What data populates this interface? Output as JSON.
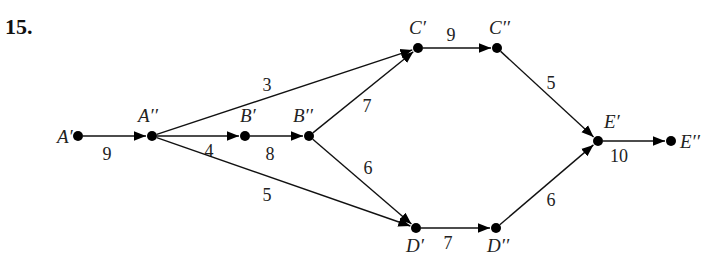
{
  "problem_number": "15.",
  "nodes": [
    {
      "id": "A1",
      "label": "A′",
      "x": 78,
      "y": 136,
      "lx": 57,
      "ly": 143
    },
    {
      "id": "A2",
      "label": "A′′",
      "x": 152,
      "y": 136,
      "lx": 138,
      "ly": 122
    },
    {
      "id": "B1",
      "label": "B′",
      "x": 245,
      "y": 136,
      "lx": 240,
      "ly": 122
    },
    {
      "id": "B2",
      "label": "B′′",
      "x": 309,
      "y": 136,
      "lx": 293,
      "ly": 122
    },
    {
      "id": "C1",
      "label": "C′",
      "x": 418,
      "y": 48,
      "lx": 409,
      "ly": 34
    },
    {
      "id": "C2",
      "label": "C′′",
      "x": 497,
      "y": 48,
      "lx": 489,
      "ly": 34
    },
    {
      "id": "D1",
      "label": "D′",
      "x": 416,
      "y": 228,
      "lx": 406,
      "ly": 252
    },
    {
      "id": "D2",
      "label": "D′′",
      "x": 496,
      "y": 228,
      "lx": 487,
      "ly": 252
    },
    {
      "id": "E1",
      "label": "E′",
      "x": 598,
      "y": 141,
      "lx": 604,
      "ly": 128
    },
    {
      "id": "E2",
      "label": "E′′",
      "x": 671,
      "y": 141,
      "lx": 680,
      "ly": 148
    }
  ],
  "edges": [
    {
      "from": "A1",
      "to": "A2",
      "weight": "9",
      "wx": 107,
      "wy": 160
    },
    {
      "from": "A2",
      "to": "B1",
      "weight": "4",
      "wx": 209,
      "wy": 157
    },
    {
      "from": "A2",
      "to": "C1",
      "weight": "3",
      "wx": 267,
      "wy": 91
    },
    {
      "from": "A2",
      "to": "D1",
      "weight": "5",
      "wx": 267,
      "wy": 201
    },
    {
      "from": "B1",
      "to": "B2",
      "weight": "8",
      "wx": 270,
      "wy": 160
    },
    {
      "from": "B2",
      "to": "C1",
      "weight": "7",
      "wx": 367,
      "wy": 112
    },
    {
      "from": "B2",
      "to": "D1",
      "weight": "6",
      "wx": 368,
      "wy": 174
    },
    {
      "from": "C1",
      "to": "C2",
      "weight": "9",
      "wx": 451,
      "wy": 41
    },
    {
      "from": "C2",
      "to": "E1",
      "weight": "5",
      "wx": 551,
      "wy": 89
    },
    {
      "from": "D1",
      "to": "D2",
      "weight": "7",
      "wx": 448,
      "wy": 249
    },
    {
      "from": "D2",
      "to": "E1",
      "weight": "6",
      "wx": 551,
      "wy": 206
    },
    {
      "from": "E1",
      "to": "E2",
      "weight": "10",
      "wx": 619,
      "wy": 162
    }
  ]
}
